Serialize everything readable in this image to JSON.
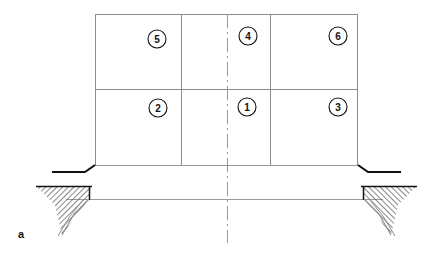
{
  "figure": {
    "caption_label": "a",
    "background_color": "#ffffff",
    "line_color": "#8c8c8c",
    "heavy_line_color": "#111111",
    "hatch_color": "#6b6b6b",
    "text_color": "#111111"
  },
  "diagram": {
    "type": "structural-elevation",
    "frame": {
      "left": 95,
      "right": 358,
      "top": 14,
      "bottom": 165,
      "mid_horizontal_y": 89,
      "interior_verticals_x": [
        181,
        270
      ]
    },
    "centerline": {
      "x": 227,
      "top": 14,
      "bottom": 243,
      "style": "dash-dot"
    },
    "ground_line": {
      "y": 199,
      "left_x": 66,
      "right_x": 383
    },
    "left_haunch": {
      "apex_x": 95,
      "apex_y": 165,
      "knee_x": 85,
      "knee_y": 172,
      "end_x": 52,
      "end_y": 172
    },
    "right_haunch": {
      "apex_x": 358,
      "apex_y": 165,
      "knee_x": 368,
      "knee_y": 172,
      "end_x": 401,
      "end_y": 172
    },
    "left_footing": {
      "top_y": 186,
      "outer_x": 36,
      "inner_x": 89,
      "toe_x": 62,
      "toe_y": 235
    },
    "right_footing": {
      "top_y": 186,
      "outer_x": 417,
      "inner_x": 364,
      "toe_x": 391,
      "toe_y": 235
    }
  },
  "callouts": [
    {
      "id": "callout-5",
      "label": "5",
      "cx": 157,
      "cy": 39,
      "r": 9
    },
    {
      "id": "callout-4",
      "label": "4",
      "cx": 248,
      "cy": 36,
      "r": 9
    },
    {
      "id": "callout-6",
      "label": "6",
      "cx": 338,
      "cy": 36,
      "r": 9
    },
    {
      "id": "callout-2",
      "label": "2",
      "cx": 158,
      "cy": 108,
      "r": 9
    },
    {
      "id": "callout-1",
      "label": "1",
      "cx": 247,
      "cy": 107,
      "r": 9
    },
    {
      "id": "callout-3",
      "label": "3",
      "cx": 338,
      "cy": 107,
      "r": 9
    }
  ]
}
